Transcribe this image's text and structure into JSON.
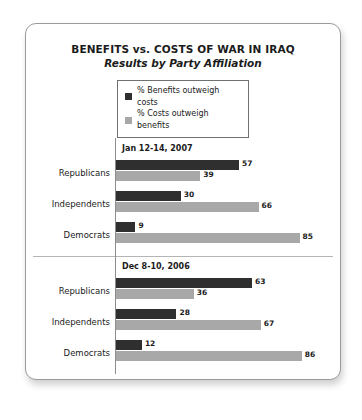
{
  "card": {
    "title": "BENEFITS vs. COSTS OF WAR IN IRAQ",
    "subtitle": "Results by Party Affiliation"
  },
  "legend": {
    "items": [
      {
        "label": "% Benefits outweigh costs",
        "color": "#2f2f2f"
      },
      {
        "label": "% Costs outweigh benefits",
        "color": "#a8a8a8"
      }
    ]
  },
  "chart_data": {
    "type": "bar",
    "orientation": "horizontal",
    "title": "BENEFITS vs. COSTS OF WAR IN IRAQ",
    "subtitle": "Results by Party Affiliation",
    "xlabel": "",
    "ylabel": "",
    "xlim": [
      0,
      100
    ],
    "grid": false,
    "legend_position": "top-center",
    "categories": [
      "Republicans",
      "Independents",
      "Democrats"
    ],
    "series": [
      {
        "name": "% Benefits outweigh costs",
        "color": "#2f2f2f"
      },
      {
        "name": "% Costs outweigh benefits",
        "color": "#a8a8a8"
      }
    ],
    "panels": [
      {
        "date": "Jan 12-14, 2007",
        "values": {
          "% Benefits outweigh costs": [
            57,
            30,
            9
          ],
          "% Costs outweigh benefits": [
            39,
            66,
            85
          ]
        }
      },
      {
        "date": "Dec 8-10, 2006",
        "values": {
          "% Benefits outweigh costs": [
            63,
            28,
            12
          ],
          "% Costs outweigh benefits": [
            36,
            67,
            86
          ]
        }
      }
    ]
  }
}
